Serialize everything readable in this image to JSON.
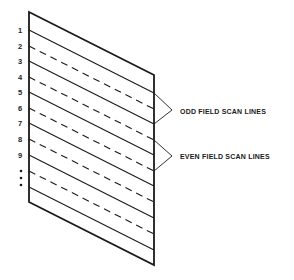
{
  "diagram": {
    "line_numbers": [
      "1",
      "2",
      "3",
      "4",
      "5",
      "6",
      "7",
      "8",
      "9"
    ],
    "continuation": "⋮",
    "labels": {
      "odd": "ODD FIELD SCAN LINES",
      "even": "EVEN FIELD SCAN LINES"
    },
    "line_styles": {
      "odd": "solid",
      "even": "dashed"
    },
    "colors": {
      "stroke": "#1a1a1a",
      "background": "#ffffff"
    }
  }
}
